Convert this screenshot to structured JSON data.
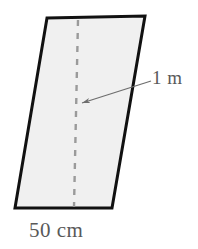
{
  "figure": {
    "kind": "parallelogram-area-diagram",
    "shape_name": "parallelogram",
    "fill_color": "#f0f0f0",
    "stroke_color": "#111111",
    "stroke_width": 3,
    "annotation_color": "#6e6e6e",
    "background_color": "#ffffff",
    "vertices": [
      {
        "name": "top-left",
        "x": 47,
        "y": 18
      },
      {
        "name": "top-right",
        "x": 145,
        "y": 16
      },
      {
        "name": "bottom-right",
        "x": 112,
        "y": 208
      },
      {
        "name": "bottom-left",
        "x": 15,
        "y": 208
      }
    ],
    "height_line": {
      "style": "dashed",
      "orientation": "vertical",
      "color": "#9a9a9a",
      "dash_pattern": "6 7",
      "from": {
        "x": 78,
        "y": 20
      },
      "to": {
        "x": 74,
        "y": 207
      }
    },
    "leader": {
      "color": "#6e6e6e",
      "from": {
        "x": 151,
        "y": 81
      },
      "to": {
        "x": 80,
        "y": 104
      },
      "arrowhead_at": "to"
    },
    "labels": {
      "height": "1 m",
      "base": "50 cm"
    }
  }
}
